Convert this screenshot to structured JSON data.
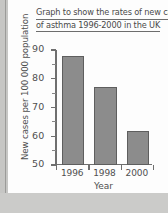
{
  "chart_data": {
    "type": "bar",
    "title": "Graph to show the rates of new cases of asthma 1996-2000 in the UK",
    "title_lines": [
      "Graph to show the rates of new cases",
      "of asthma 1996-2000 in the UK"
    ],
    "categories": [
      "1996",
      "1998",
      "2000"
    ],
    "values": [
      88,
      77,
      62
    ],
    "xlabel": "Year",
    "ylabel": "New cases per 100 000 population",
    "ylim": [
      50,
      90
    ],
    "ytick_labels": [
      "50",
      "60",
      "70",
      "80",
      "90"
    ],
    "ytick_values": [
      50,
      60,
      70,
      80,
      90
    ],
    "minor_tick_step": 5,
    "grid": false,
    "legend": null,
    "bar_color": "#8c8c8c",
    "bar_edge_color": "#5e5e5e",
    "axis_color": "#6f6f6f",
    "text_color": "#4f4f4f",
    "background_color": "#fdfdfd"
  }
}
